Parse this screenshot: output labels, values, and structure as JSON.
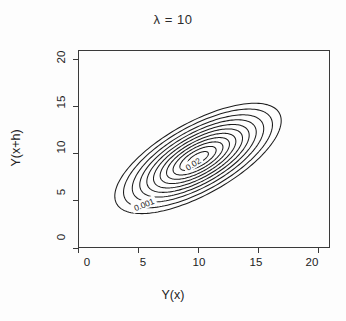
{
  "chart_data": {
    "type": "contour",
    "title": "λ = 10",
    "xlabel": "Y(x)",
    "ylabel": "Y(x+h)",
    "xlim": [
      0,
      21
    ],
    "ylim": [
      0,
      21
    ],
    "xticks": [
      0,
      5,
      10,
      15,
      20
    ],
    "yticks": [
      0,
      5,
      10,
      15,
      20
    ],
    "xtick_labels": [
      "0",
      "5",
      "10",
      "15",
      "20"
    ],
    "ytick_labels": [
      "0",
      "5",
      "10",
      "15",
      "20"
    ],
    "grid": false,
    "legend": "none",
    "center": [
      10.0,
      9.5
    ],
    "contour_levels": [
      0.001,
      0.002,
      0.004,
      0.006,
      0.008,
      0.01,
      0.012,
      0.014,
      0.016,
      0.018,
      0.02
    ],
    "labeled_levels": [
      {
        "value": "0.001",
        "x": 5.5,
        "y": 4.6,
        "rotation": -22
      },
      {
        "value": "0.02",
        "x": 9.6,
        "y": 8.9,
        "rotation": -33
      }
    ],
    "ellipse_geometry": {
      "rotation_deg": 38,
      "semi_major_outer": 8.35,
      "semi_minor_outer": 3.55,
      "note": "each successive inner contour scales the outer semi-axes by a shrink factor"
    },
    "ellipse_scales": [
      1.0,
      0.895,
      0.79,
      0.7,
      0.615,
      0.535,
      0.455,
      0.378,
      0.3,
      0.218,
      0.125
    ]
  },
  "axis": {
    "x_title": "Y(x)",
    "y_title": "Y(x+h)"
  },
  "title": {
    "text": "λ = 10"
  }
}
